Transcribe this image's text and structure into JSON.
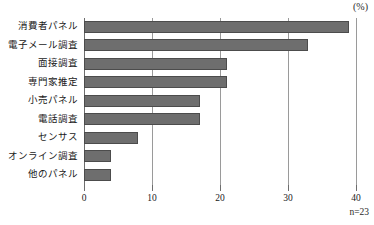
{
  "chart_data": {
    "type": "bar",
    "orientation": "horizontal",
    "title": "",
    "xlabel": "",
    "ylabel": "",
    "unit_label": "(%)",
    "note": "n=23",
    "xlim": [
      0,
      40
    ],
    "xticks": [
      0,
      10,
      20,
      30,
      40
    ],
    "xtick_labels": [
      "0",
      "10",
      "20",
      "30",
      "40"
    ],
    "grid": true,
    "grid_axis": "x",
    "legend": false,
    "bar_color": "#6e6e6e",
    "bar_border_color": "#4c4c4c",
    "grid_color": "#9a9a9a",
    "categories": [
      "消費者パネル",
      "電子メール調査",
      "面接調査",
      "専門家推定",
      "小売パネル",
      "電話調査",
      "センサス",
      "オンライン調査",
      "他のパネル"
    ],
    "values": [
      39,
      33,
      21,
      21,
      17,
      17,
      8,
      4,
      4
    ]
  }
}
